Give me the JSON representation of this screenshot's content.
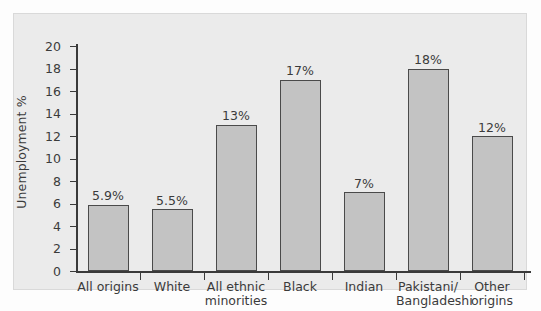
{
  "chart_data": {
    "type": "bar",
    "title": "",
    "xlabel": "",
    "ylabel": "Unemployment %",
    "ylim": [
      0,
      20
    ],
    "ytick_step": 2,
    "yticks": [
      "20",
      "18",
      "16",
      "14",
      "12",
      "10",
      "8",
      "6",
      "4",
      "2",
      "0"
    ],
    "grid": false,
    "legend": null,
    "categories": [
      "All origins",
      "White",
      "All ethnic\nminorities",
      "Black",
      "Indian",
      "Pakistani/\nBangladeshi",
      "Other\norigins"
    ],
    "values": [
      5.9,
      5.5,
      13,
      17,
      7,
      18,
      12
    ],
    "value_labels": [
      "5.9%",
      "5.5%",
      "13%",
      "17%",
      "7%",
      "18%",
      "12%"
    ],
    "bar_fill_color": "#c3c3c3",
    "bar_edge_color": "#4a4a4a",
    "background_color": "#ebebeb",
    "axis_color": "#3a3a3a",
    "text_color": "#3b3b3b"
  }
}
